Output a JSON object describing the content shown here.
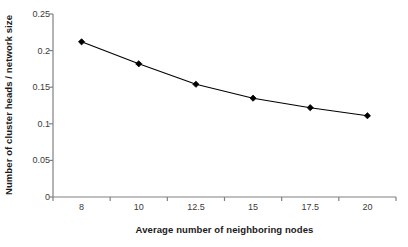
{
  "chart_data": {
    "type": "line",
    "title": "",
    "subtitle": "",
    "xlabel": "Average number of neighboring nodes",
    "ylabel": "Number of cluster heads / network size",
    "categories": [
      "8",
      "10",
      "12.5",
      "15",
      "17.5",
      "20"
    ],
    "values": [
      0.212,
      0.182,
      0.154,
      0.135,
      0.122,
      0.111
    ],
    "series": [
      {
        "name": "",
        "values": [
          0.212,
          0.182,
          0.154,
          0.135,
          0.122,
          0.111
        ]
      }
    ],
    "ylim": [
      0,
      0.25
    ],
    "ytick_labels": [
      "0",
      "0.05",
      "0.1",
      "0.15",
      "0.2",
      "0.25"
    ],
    "ytick_values": [
      0,
      0.05,
      0.1,
      0.15,
      0.2,
      0.25
    ],
    "xtick_labels": [
      "8",
      "10",
      "12.5",
      "15",
      "17.5",
      "20"
    ],
    "grid": false,
    "legend": "none",
    "marker": "diamond",
    "marker_color": "#000000",
    "line_color": "#000000",
    "axis_color": "#808080",
    "background_color": "#FFFFFF"
  }
}
